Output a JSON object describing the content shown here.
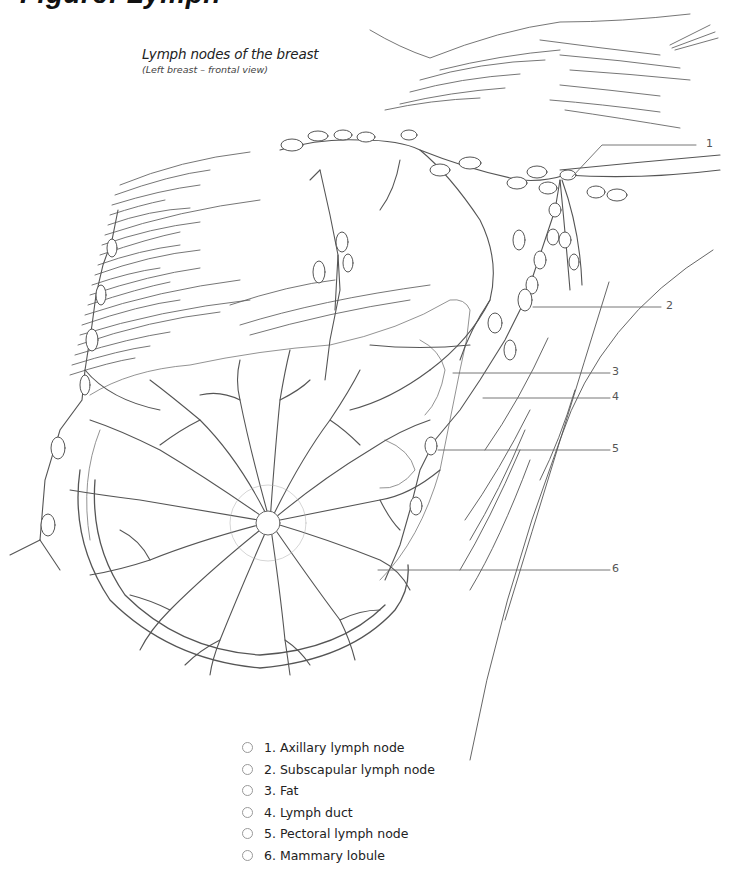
{
  "page": {
    "heading_fragment": "Figure: Lymph"
  },
  "figure": {
    "title": "Lymph nodes of the breast",
    "subtitle": "(Left breast – frontal view)",
    "line_color": "#555555",
    "callouts": [
      {
        "number": "1",
        "x": 708,
        "y": 137
      },
      {
        "number": "2",
        "x": 669,
        "y": 300
      },
      {
        "number": "3",
        "x": 611,
        "y": 367
      },
      {
        "number": "4",
        "x": 611,
        "y": 391
      },
      {
        "number": "5",
        "x": 611,
        "y": 443
      },
      {
        "number": "6",
        "x": 611,
        "y": 563
      }
    ]
  },
  "legend": {
    "items": [
      {
        "number": "1",
        "label": "1. Axillary lymph node"
      },
      {
        "number": "2",
        "label": "2. Subscapular lymph node"
      },
      {
        "number": "3",
        "label": "3. Fat"
      },
      {
        "number": "4",
        "label": "4. Lymph duct"
      },
      {
        "number": "5",
        "label": "5. Pectoral lymph node"
      },
      {
        "number": "6",
        "label": "6. Mammary lobule"
      }
    ]
  }
}
